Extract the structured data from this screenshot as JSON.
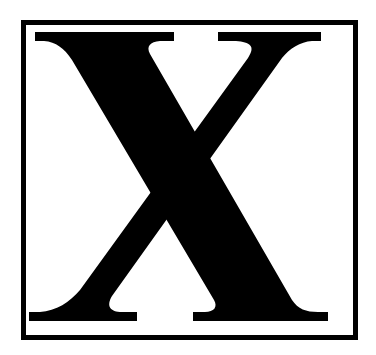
{
  "image": {
    "letter": "X",
    "description": "Bold serif capital letter X inside a square black border",
    "colors": {
      "background": "#ffffff",
      "glyph": "#000000",
      "border": "#000000"
    }
  }
}
